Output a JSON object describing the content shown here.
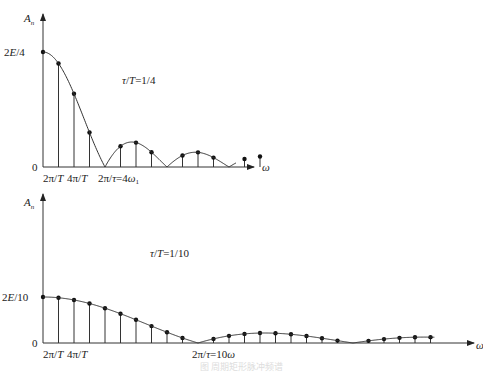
{
  "chart_data": [
    {
      "type": "bar",
      "title": "τ/T=1/4",
      "annotation": "τ/T=1/4",
      "ylabel": "Aₙ",
      "xlabel": "ω",
      "y_tick_labels": [
        "0",
        "2E/4"
      ],
      "x_tick_labels": [
        "2π/T",
        "4π/T",
        "2π/τ=4ω₁"
      ],
      "ratio": 0.25,
      "harmonics": [
        0,
        1,
        2,
        3,
        4,
        5,
        6,
        7,
        8,
        9,
        10,
        11,
        12,
        13,
        14
      ],
      "values_normalized": [
        1.0,
        0.9003,
        0.6366,
        0.3001,
        0.0,
        0.1801,
        0.2122,
        0.1286,
        0.0,
        0.1,
        0.1273,
        0.0818,
        0.0,
        0.0693,
        0.0909
      ],
      "envelope": "|sin(nπτ/T)/(nπτ/T)|",
      "zeros_at_harmonic": [
        4,
        8,
        12
      ]
    },
    {
      "type": "bar",
      "title": "τ/T=1/10",
      "annotation": "τ/T=1/10",
      "ylabel": "Aₙ",
      "xlabel": "ω",
      "y_tick_labels": [
        "0",
        "2E/10"
      ],
      "x_tick_labels": [
        "2π/T",
        "4π/T",
        "2π/τ=10ω"
      ],
      "ratio": 0.1,
      "harmonics": [
        0,
        1,
        2,
        3,
        4,
        5,
        6,
        7,
        8,
        9,
        10,
        11,
        12,
        13,
        14,
        15,
        16,
        17,
        18,
        19,
        20,
        21,
        22,
        23,
        24,
        25
      ],
      "values_normalized": [
        1.0,
        0.9836,
        0.9355,
        0.8584,
        0.7568,
        0.6366,
        0.5046,
        0.3679,
        0.2339,
        0.1093,
        0.0,
        0.0894,
        0.1559,
        0.1981,
        0.2162,
        0.2122,
        0.1892,
        0.1514,
        0.1039,
        0.0517,
        0.0,
        0.0468,
        0.085,
        0.112,
        0.1261,
        0.1273
      ],
      "envelope": "|sin(nπτ/T)/(nπτ/T)|",
      "zeros_at_harmonic": [
        10,
        20
      ]
    }
  ],
  "top": {
    "y_axis_label": "A",
    "y_axis_sub": "n",
    "peak_label": "2E/4",
    "zero_label": "0",
    "x_axis_label": "ω",
    "tick1": "2π/T",
    "tick2": "4π/T",
    "tick3": "2π/τ=4ω",
    "tick3_sub": "1",
    "ratio_label": "τ/T=1/4"
  },
  "bottom": {
    "y_axis_label": "A",
    "y_axis_sub": "n",
    "peak_label": "2E/10",
    "zero_label": "0",
    "x_axis_label": "ω",
    "tick1": "2π/T",
    "tick2": "4π/T",
    "tick3": "2π/τ=10ω",
    "ratio_label": "τ/T=1/10"
  },
  "caption": "图 周期矩形脉冲频谱"
}
